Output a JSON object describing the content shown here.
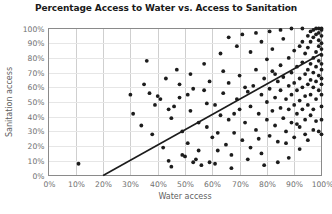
{
  "chart_data": {
    "type": "scatter",
    "title": "Percentage Access to Water vs. Access to Sanitation",
    "xlabel": "Water access",
    "ylabel": "Sanitation access",
    "xlim": [
      0,
      100
    ],
    "ylim": [
      0,
      100
    ],
    "grid": true,
    "legend": null,
    "x_ticks": [
      "0%",
      "10%",
      "20%",
      "30%",
      "40%",
      "50%",
      "60%",
      "70%",
      "80%",
      "90%",
      "100%"
    ],
    "y_ticks": [
      "0%",
      "10%",
      "20%",
      "30%",
      "40%",
      "50%",
      "60%",
      "70%",
      "80%",
      "90%",
      "100%"
    ],
    "marker_color": "#1c1c1c",
    "trendline_color": "#1c1c1c",
    "gridline_color": "#cfcfcf",
    "trendline": {
      "x0": 20,
      "y0": 0,
      "x1": 100,
      "y1": 83
    },
    "series": [
      {
        "name": "Countries",
        "points": [
          [
            11,
            8
          ],
          [
            36,
            78
          ],
          [
            37,
            56
          ],
          [
            40,
            54
          ],
          [
            41,
            52
          ],
          [
            44,
            10
          ],
          [
            45,
            6
          ],
          [
            46,
            47
          ],
          [
            48,
            62
          ],
          [
            49,
            30
          ],
          [
            50,
            13
          ],
          [
            51,
            22
          ],
          [
            52,
            44
          ],
          [
            53,
            9
          ],
          [
            54,
            11
          ],
          [
            55,
            36
          ],
          [
            56,
            7
          ],
          [
            57,
            58
          ],
          [
            58,
            33
          ],
          [
            59,
            9
          ],
          [
            60,
            26
          ],
          [
            61,
            48
          ],
          [
            62,
            17
          ],
          [
            63,
            41
          ],
          [
            64,
            56
          ],
          [
            65,
            21
          ],
          [
            66,
            63
          ],
          [
            66,
            38
          ],
          [
            67,
            14
          ],
          [
            68,
            29
          ],
          [
            69,
            52
          ],
          [
            70,
            45
          ],
          [
            70,
            68
          ],
          [
            71,
            24
          ],
          [
            72,
            36
          ],
          [
            73,
            57
          ],
          [
            74,
            19
          ],
          [
            74,
            47
          ],
          [
            75,
            61
          ],
          [
            76,
            31
          ],
          [
            76,
            72
          ],
          [
            77,
            42
          ],
          [
            78,
            55
          ],
          [
            78,
            15
          ],
          [
            79,
            66
          ],
          [
            80,
            38
          ],
          [
            80,
            50
          ],
          [
            80,
            79
          ],
          [
            81,
            27
          ],
          [
            81,
            59
          ],
          [
            82,
            44
          ],
          [
            82,
            71
          ],
          [
            83,
            34
          ],
          [
            83,
            53
          ],
          [
            84,
            64
          ],
          [
            84,
            23
          ],
          [
            85,
            46
          ],
          [
            85,
            75
          ],
          [
            85,
            58
          ],
          [
            86,
            39
          ],
          [
            86,
            67
          ],
          [
            87,
            52
          ],
          [
            87,
            30
          ],
          [
            88,
            61
          ],
          [
            88,
            80
          ],
          [
            88,
            45
          ],
          [
            89,
            55
          ],
          [
            89,
            70
          ],
          [
            89,
            36
          ],
          [
            90,
            48
          ],
          [
            90,
            63
          ],
          [
            90,
            85
          ],
          [
            90,
            26
          ],
          [
            91,
            58
          ],
          [
            91,
            74
          ],
          [
            91,
            42
          ],
          [
            92,
            66
          ],
          [
            92,
            51
          ],
          [
            92,
            88
          ],
          [
            92,
            33
          ],
          [
            93,
            60
          ],
          [
            93,
            77
          ],
          [
            93,
            45
          ],
          [
            93,
            91
          ],
          [
            94,
            69
          ],
          [
            94,
            54
          ],
          [
            94,
            83
          ],
          [
            94,
            38
          ],
          [
            95,
            72
          ],
          [
            95,
            62
          ],
          [
            95,
            87
          ],
          [
            95,
            48
          ],
          [
            95,
            95
          ],
          [
            96,
            76
          ],
          [
            96,
            65
          ],
          [
            96,
            91
          ],
          [
            96,
            55
          ],
          [
            96,
            98
          ],
          [
            97,
            80
          ],
          [
            97,
            70
          ],
          [
            97,
            94
          ],
          [
            97,
            60
          ],
          [
            97,
            99
          ],
          [
            97,
            45
          ],
          [
            98,
            84
          ],
          [
            98,
            74
          ],
          [
            98,
            96
          ],
          [
            98,
            64
          ],
          [
            98,
            100
          ],
          [
            98,
            52
          ],
          [
            99,
            88
          ],
          [
            99,
            78
          ],
          [
            99,
            97
          ],
          [
            99,
            68
          ],
          [
            99,
            100
          ],
          [
            99,
            58
          ],
          [
            99,
            92
          ],
          [
            100,
            90
          ],
          [
            100,
            82
          ],
          [
            100,
            99
          ],
          [
            100,
            72
          ],
          [
            100,
            100
          ],
          [
            100,
            62
          ],
          [
            100,
            95
          ],
          [
            100,
            86
          ],
          [
            100,
            76
          ],
          [
            100,
            66
          ],
          [
            100,
            55
          ],
          [
            100,
            47
          ],
          [
            63,
            83
          ],
          [
            69,
            88
          ],
          [
            74,
            84
          ],
          [
            78,
            91
          ],
          [
            82,
            86
          ],
          [
            86,
            93
          ],
          [
            57,
            76
          ],
          [
            52,
            69
          ],
          [
            47,
            72
          ],
          [
            43,
            66
          ],
          [
            66,
            94
          ],
          [
            71,
            96
          ],
          [
            76,
            97
          ],
          [
            81,
            98
          ],
          [
            85,
            99
          ],
          [
            89,
            100
          ],
          [
            93,
            100
          ],
          [
            84,
            9
          ],
          [
            88,
            12
          ],
          [
            92,
            18
          ],
          [
            95,
            24
          ],
          [
            97,
            31
          ],
          [
            79,
            7
          ],
          [
            73,
            11
          ],
          [
            67,
            5
          ],
          [
            61,
            8
          ],
          [
            55,
            17
          ],
          [
            49,
            14
          ],
          [
            42,
            19
          ],
          [
            38,
            28
          ],
          [
            34,
            34
          ],
          [
            31,
            42
          ],
          [
            45,
            39
          ],
          [
            51,
            55
          ],
          [
            58,
            49
          ],
          [
            62,
            29
          ],
          [
            68,
            42
          ],
          [
            72,
            60
          ],
          [
            77,
            25
          ],
          [
            83,
            69
          ],
          [
            87,
            22
          ],
          [
            91,
            35
          ],
          [
            94,
            28
          ],
          [
            96,
            41
          ],
          [
            98,
            37
          ],
          [
            99,
            30
          ],
          [
            100,
            38
          ],
          [
            100,
            28
          ],
          [
            64,
            71
          ],
          [
            59,
            64
          ],
          [
            53,
            59
          ],
          [
            48,
            53
          ],
          [
            44,
            45
          ],
          [
            39,
            48
          ],
          [
            35,
            62
          ],
          [
            30,
            55
          ]
        ]
      }
    ]
  }
}
